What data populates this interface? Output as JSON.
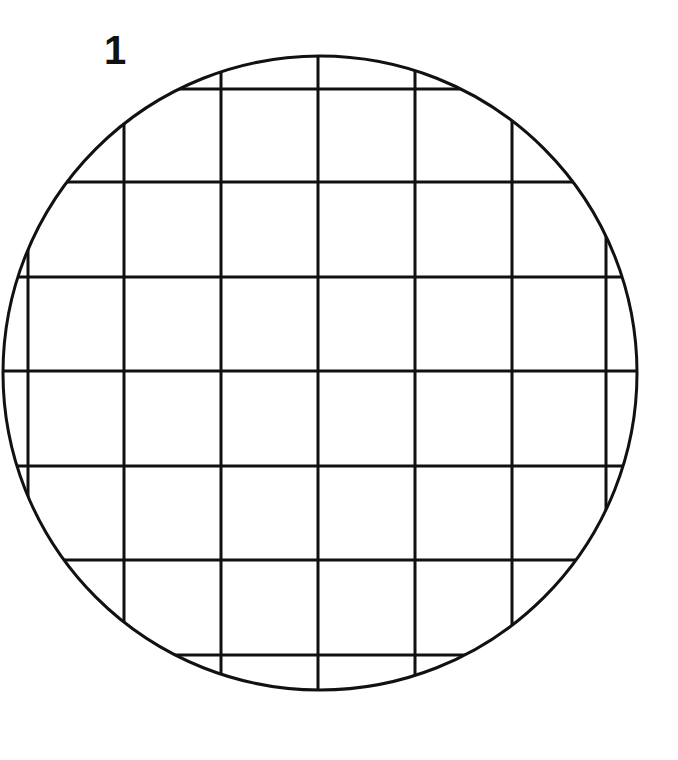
{
  "figure": {
    "label": "1",
    "circle": {
      "cx": 320,
      "cy": 373,
      "r": 317
    },
    "grid": {
      "vertical_x": [
        28,
        124,
        221,
        318,
        415,
        512,
        606
      ],
      "horizontal_y": [
        89,
        182,
        277,
        371,
        466,
        560,
        655
      ]
    },
    "colors": {
      "stroke": "#111111",
      "background": "#ffffff"
    }
  }
}
